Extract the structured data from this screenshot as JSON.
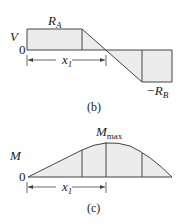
{
  "shear_diagram": {
    "axis_label": "V",
    "zero_label": "0",
    "top_label_main": "R",
    "top_label_sub": "A",
    "bottom_label_prefix": "−R",
    "bottom_label_sub": "B",
    "dimension_label_main": "x",
    "dimension_label_sub": "1",
    "caption": "(b)"
  },
  "moment_diagram": {
    "axis_label": "M",
    "zero_label": "0",
    "peak_label_main": "M",
    "peak_label_sub": "max",
    "dimension_label_main": "x",
    "dimension_label_sub": "1",
    "caption": "(c)"
  },
  "colors": {
    "line": "#444444",
    "fill": "#ececec"
  }
}
